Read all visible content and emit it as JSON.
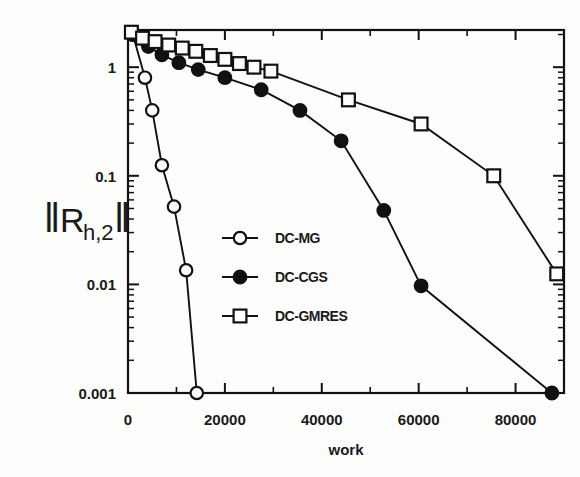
{
  "chart_data": {
    "type": "line",
    "title": "",
    "xlabel": "work",
    "ylabel": "‖R h,2‖",
    "ylabel_parts": {
      "bar": "‖",
      "main": "R",
      "sub": "h,2"
    },
    "xlim": [
      0,
      90000
    ],
    "ylim": [
      0.001,
      2.2
    ],
    "yscale": "log",
    "xscale": "linear",
    "grid": false,
    "legend_position": "center",
    "xticks": [
      0,
      20000,
      40000,
      60000,
      80000
    ],
    "xtick_labels": [
      "0",
      "20000",
      "40000",
      "60000",
      "80000"
    ],
    "xminor_step": 10000,
    "yticks": [
      1,
      0.1,
      0.01,
      0.001
    ],
    "ytick_labels": [
      "1",
      "0.1",
      "0.01",
      "0.001"
    ],
    "series": [
      {
        "name": "DC-MG",
        "marker": "open-circle",
        "color": "#111111",
        "x": [
          1000,
          3500,
          5000,
          7000,
          9500,
          12000,
          14200
        ],
        "y": [
          2.0,
          0.8,
          0.4,
          0.125,
          0.052,
          0.0135,
          0.001
        ]
      },
      {
        "name": "DC-CGS",
        "marker": "filled-circle",
        "color": "#111111",
        "x": [
          1000,
          4200,
          7000,
          10500,
          14500,
          20000,
          27500,
          35500,
          44000,
          52800,
          60500,
          87500
        ],
        "y": [
          2.0,
          1.55,
          1.3,
          1.1,
          0.95,
          0.8,
          0.62,
          0.4,
          0.21,
          0.048,
          0.0097,
          0.001
        ]
      },
      {
        "name": "DC-GMRES",
        "marker": "open-square",
        "color": "#111111",
        "x": [
          700,
          3000,
          5600,
          8400,
          11200,
          14000,
          17000,
          20000,
          23000,
          26000,
          29500,
          45500,
          60500,
          75500,
          88500
        ],
        "y": [
          2.1,
          1.85,
          1.72,
          1.6,
          1.5,
          1.4,
          1.28,
          1.18,
          1.08,
          1.0,
          0.92,
          0.5,
          0.3,
          0.1,
          0.0125
        ]
      }
    ],
    "legend_entries": [
      {
        "label": "DC-MG",
        "marker": "open-circle"
      },
      {
        "label": "DC-CGS",
        "marker": "filled-circle"
      },
      {
        "label": "DC-GMRES",
        "marker": "open-square"
      }
    ]
  },
  "colors": {
    "ink": "#111111",
    "background": "#fdfdfb"
  }
}
